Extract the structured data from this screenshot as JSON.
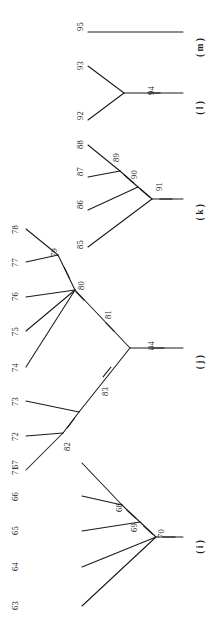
{
  "figure": {
    "type": "phylogenetic-tree",
    "orientation": "rotated-90",
    "line_color": "#1a1a1a",
    "background": "#ffffff"
  },
  "groups": [
    {
      "key": "m",
      "label": "( m )",
      "x": 196,
      "y": 38
    },
    {
      "key": "l",
      "label": "( l )",
      "x": 196,
      "y": 101
    },
    {
      "key": "k",
      "label": "( k )",
      "x": 196,
      "y": 204
    },
    {
      "key": "j",
      "label": "( j )",
      "x": 196,
      "y": 355
    },
    {
      "key": "i",
      "label": "( i )",
      "x": 196,
      "y": 540
    }
  ],
  "node_labels": [
    {
      "id": "63",
      "x": 11,
      "y": 601
    },
    {
      "id": "64",
      "x": 11,
      "y": 562
    },
    {
      "id": "65",
      "x": 11,
      "y": 526
    },
    {
      "id": "66",
      "x": 11,
      "y": 492
    },
    {
      "id": "67",
      "x": 11,
      "y": 460
    },
    {
      "id": "68",
      "x": 115,
      "y": 503
    },
    {
      "id": "69",
      "x": 130,
      "y": 523
    },
    {
      "id": "70",
      "x": 157,
      "y": 529
    },
    {
      "id": "71",
      "x": 11,
      "y": 466
    },
    {
      "id": "72",
      "x": 11,
      "y": 432
    },
    {
      "id": "73",
      "x": 11,
      "y": 397
    },
    {
      "id": "74",
      "x": 11,
      "y": 363
    },
    {
      "id": "75",
      "x": 11,
      "y": 327
    },
    {
      "id": "76",
      "x": 11,
      "y": 292
    },
    {
      "id": "77",
      "x": 11,
      "y": 258
    },
    {
      "id": "78",
      "x": 11,
      "y": 225
    },
    {
      "id": "79",
      "x": 50,
      "y": 248
    },
    {
      "id": "80",
      "x": 77,
      "y": 281
    },
    {
      "id": "81",
      "x": 104,
      "y": 310
    },
    {
      "id": "82",
      "x": 63,
      "y": 442
    },
    {
      "id": "83",
      "x": 101,
      "y": 387
    },
    {
      "id": "84",
      "x": 147,
      "y": 341
    },
    {
      "id": "85",
      "x": 76,
      "y": 240
    },
    {
      "id": "86",
      "x": 76,
      "y": 200
    },
    {
      "id": "87",
      "x": 76,
      "y": 167
    },
    {
      "id": "88",
      "x": 76,
      "y": 140
    },
    {
      "id": "89",
      "x": 112,
      "y": 153
    },
    {
      "id": "90",
      "x": 130,
      "y": 170
    },
    {
      "id": "91",
      "x": 155,
      "y": 182
    },
    {
      "id": "92",
      "x": 76,
      "y": 111
    },
    {
      "id": "93",
      "x": 76,
      "y": 61
    },
    {
      "id": "94",
      "x": 147,
      "y": 86
    },
    {
      "id": "95",
      "x": 76,
      "y": 22
    }
  ],
  "branches": {
    "m": [
      {
        "name": "branch-95",
        "x1": 88,
        "y1": 32,
        "x2": 183,
        "y2": 32
      }
    ],
    "l": [
      {
        "name": "branch-93",
        "x1": 88,
        "y1": 66,
        "x2": 124,
        "y2": 93
      },
      {
        "name": "branch-92",
        "x1": 88,
        "y1": 120,
        "x2": 124,
        "y2": 93
      },
      {
        "name": "branch-94",
        "x1": 124,
        "y1": 93,
        "x2": 183,
        "y2": 93
      }
    ],
    "k": [
      {
        "name": "branch-88",
        "x1": 88,
        "y1": 145,
        "x2": 120,
        "y2": 171
      },
      {
        "name": "branch-87",
        "x1": 88,
        "y1": 177,
        "x2": 120,
        "y2": 171
      },
      {
        "name": "branch-89",
        "x1": 120,
        "y1": 171,
        "x2": 138,
        "y2": 187
      },
      {
        "name": "branch-86",
        "x1": 88,
        "y1": 210,
        "x2": 138,
        "y2": 187
      },
      {
        "name": "branch-90",
        "x1": 138,
        "y1": 187,
        "x2": 152,
        "y2": 199
      },
      {
        "name": "branch-85",
        "x1": 88,
        "y1": 247,
        "x2": 152,
        "y2": 199
      },
      {
        "name": "branch-91",
        "x1": 152,
        "y1": 199,
        "x2": 183,
        "y2": 199
      }
    ],
    "j": [
      {
        "name": "branch-78",
        "x1": 26,
        "y1": 229,
        "x2": 58,
        "y2": 255
      },
      {
        "name": "branch-77",
        "x1": 26,
        "y1": 262,
        "x2": 58,
        "y2": 255
      },
      {
        "name": "branch-79",
        "x1": 58,
        "y1": 255,
        "x2": 75,
        "y2": 290
      },
      {
        "name": "branch-76",
        "x1": 26,
        "y1": 297,
        "x2": 75,
        "y2": 290
      },
      {
        "name": "branch-75",
        "x1": 26,
        "y1": 331,
        "x2": 75,
        "y2": 290
      },
      {
        "name": "branch-74",
        "x1": 26,
        "y1": 367,
        "x2": 75,
        "y2": 290
      },
      {
        "name": "branch-81",
        "x1": 75,
        "y1": 290,
        "x2": 130,
        "y2": 348
      },
      {
        "name": "branch-71",
        "x1": 26,
        "y1": 470,
        "x2": 63,
        "y2": 433
      },
      {
        "name": "branch-72",
        "x1": 26,
        "y1": 436,
        "x2": 63,
        "y2": 433
      },
      {
        "name": "branch-82",
        "x1": 63,
        "y1": 433,
        "x2": 79,
        "y2": 412
      },
      {
        "name": "branch-73",
        "x1": 26,
        "y1": 401,
        "x2": 79,
        "y2": 412
      },
      {
        "name": "branch-83",
        "x1": 79,
        "y1": 412,
        "x2": 130,
        "y2": 348
      },
      {
        "name": "branch-84",
        "x1": 130,
        "y1": 348,
        "x2": 183,
        "y2": 348
      }
    ],
    "i": [
      {
        "name": "branch-67",
        "x1": 82,
        "y1": 463,
        "x2": 122,
        "y2": 505
      },
      {
        "name": "branch-66",
        "x1": 82,
        "y1": 496,
        "x2": 122,
        "y2": 505
      },
      {
        "name": "branch-68",
        "x1": 122,
        "y1": 505,
        "x2": 140,
        "y2": 522
      },
      {
        "name": "branch-65",
        "x1": 82,
        "y1": 531,
        "x2": 140,
        "y2": 522
      },
      {
        "name": "branch-69",
        "x1": 140,
        "y1": 522,
        "x2": 156,
        "y2": 537
      },
      {
        "name": "branch-64",
        "x1": 82,
        "y1": 567,
        "x2": 156,
        "y2": 537
      },
      {
        "name": "branch-63",
        "x1": 82,
        "y1": 606,
        "x2": 156,
        "y2": 537
      },
      {
        "name": "branch-70",
        "x1": 156,
        "y1": 537,
        "x2": 183,
        "y2": 537
      }
    ]
  },
  "tick_marks": [
    {
      "name": "tick-94",
      "cx": 154,
      "cy": 93,
      "angle": 0
    },
    {
      "name": "tick-89",
      "cx": 129,
      "cy": 179,
      "angle": 41
    },
    {
      "name": "tick-90",
      "cx": 145,
      "cy": 193,
      "angle": 41
    },
    {
      "name": "tick-91",
      "cx": 166,
      "cy": 199,
      "angle": 0
    },
    {
      "name": "tick-79",
      "cx": 67,
      "cy": 273,
      "angle": 64
    },
    {
      "name": "tick-80",
      "cx": 80,
      "cy": 296,
      "angle": 46
    },
    {
      "name": "tick-81",
      "cx": 110,
      "cy": 327,
      "angle": 46
    },
    {
      "name": "tick-82",
      "cx": 71,
      "cy": 423,
      "angle": -53
    },
    {
      "name": "tick-83",
      "cx": 107,
      "cy": 372,
      "angle": -51
    },
    {
      "name": "tick-84",
      "cx": 158,
      "cy": 348,
      "angle": 0
    },
    {
      "name": "tick-68",
      "cx": 131,
      "cy": 514,
      "angle": 43
    },
    {
      "name": "tick-69",
      "cx": 148,
      "cy": 530,
      "angle": 43
    },
    {
      "name": "tick-70",
      "cx": 169,
      "cy": 537,
      "angle": 0
    }
  ]
}
